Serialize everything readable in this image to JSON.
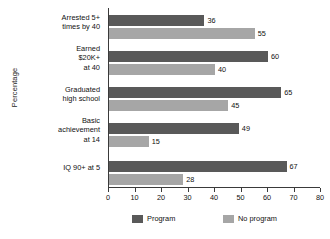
{
  "chart_data": {
    "type": "bar",
    "orientation": "horizontal",
    "title": "",
    "xlabel": "",
    "ylabel": "Percentage",
    "xlim": [
      0,
      80
    ],
    "xticks": [
      0,
      10,
      20,
      30,
      40,
      50,
      60,
      70,
      80
    ],
    "grid": false,
    "legend_position": "bottom-center",
    "categories": [
      "Arrested 5+\ntimes by 40",
      "Earned\n$20K+\nat 40",
      "Graduated\nhigh school",
      "Basic\nachievement\nat 14",
      "IQ 90+ at 5"
    ],
    "series": [
      {
        "name": "Program",
        "color": "#595959",
        "values": [
          36,
          60,
          65,
          49,
          67
        ]
      },
      {
        "name": "No program",
        "color": "#a6a6a6",
        "values": [
          55,
          40,
          45,
          15,
          28
        ]
      }
    ]
  },
  "axis": {
    "y_title": "Percentage",
    "x_tick_labels": [
      "0",
      "10",
      "20",
      "30",
      "40",
      "50",
      "60",
      "70",
      "80"
    ]
  },
  "categories": [
    {
      "line1": "Arrested 5+",
      "line2": "times by 40",
      "line3": ""
    },
    {
      "line1": "Earned",
      "line2": "$20K+",
      "line3": "at 40"
    },
    {
      "line1": "Graduated",
      "line2": "high school",
      "line3": ""
    },
    {
      "line1": "Basic",
      "line2": "achievement",
      "line3": "at 14"
    },
    {
      "line1": "IQ 90+ at 5",
      "line2": "",
      "line3": ""
    }
  ],
  "values": {
    "program": [
      "36",
      "60",
      "65",
      "49",
      "67"
    ],
    "no_program": [
      "55",
      "40",
      "45",
      "15",
      "28"
    ]
  },
  "legend": {
    "program_label": "Program",
    "no_program_label": "No program",
    "program_color": "#595959",
    "no_program_color": "#a6a6a6"
  }
}
